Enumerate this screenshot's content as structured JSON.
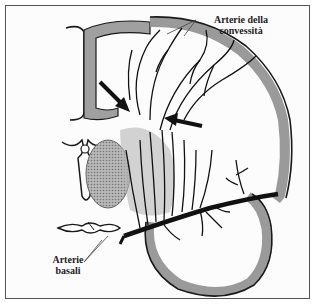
{
  "figure": {
    "type": "anatomical-illustration",
    "labels": {
      "convexity_line1": "Arterie della",
      "convexity_line2": "convessità",
      "basal_line1": "Arterie",
      "basal_line2": "basali"
    },
    "arrows": [
      {
        "name": "left-arrow",
        "direction": "down-right"
      },
      {
        "name": "right-arrow",
        "direction": "left"
      }
    ],
    "colors": {
      "line": "#1a1a1a",
      "cortex_fill": "#9a9a9a",
      "frame": "#555555",
      "background": "#fcfcfc"
    }
  }
}
